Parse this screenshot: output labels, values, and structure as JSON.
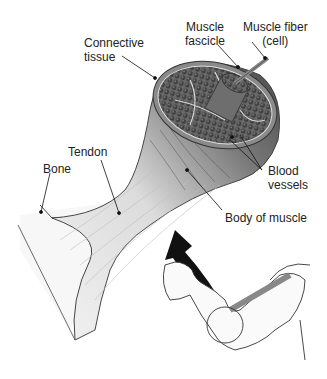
{
  "diagram": {
    "labels": {
      "connective_tissue": [
        "Connective",
        "tissue"
      ],
      "muscle_fascicle": [
        "Muscle",
        "fascicle"
      ],
      "muscle_fiber": [
        "Muscle fiber",
        "(cell)"
      ],
      "tendon": "Tendon",
      "bone": "Bone",
      "blood_vessels": [
        "Blood",
        "vessels"
      ],
      "body_of_muscle": "Body of muscle"
    },
    "colors": {
      "muscle_dark": "#4a4a4a",
      "muscle_mid": "#7a7a7a",
      "fiber_fill": "#5c5c5c",
      "tendon": "#e6e6e6",
      "outline": "#333333",
      "arrow": "#111111"
    }
  }
}
